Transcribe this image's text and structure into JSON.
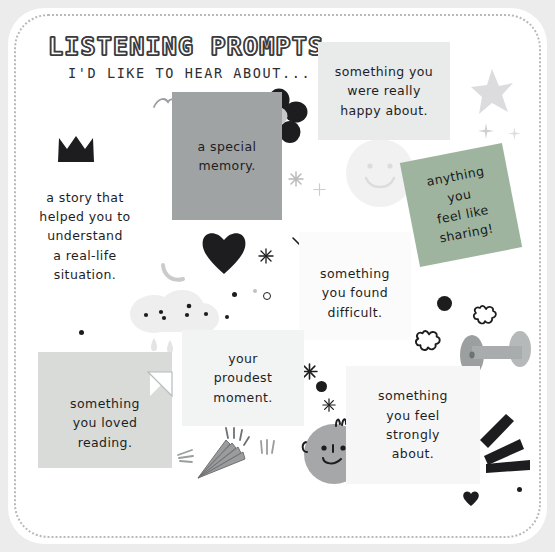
{
  "page": {
    "background_color": "#ececed",
    "card_color": "#ffffff",
    "border_style": "dotted",
    "border_color": "#b9b9bb"
  },
  "header": {
    "title": "LISTENING PROMPTS",
    "subtitle": "I'D LIKE TO HEAR ABOUT..."
  },
  "notes": [
    {
      "id": "story",
      "text": "a story that\nhelped you to\nunderstand\na real-life\nsituation.",
      "color": "transparent"
    },
    {
      "id": "special",
      "text": "a special\nmemory.",
      "color": "#a0a3a4"
    },
    {
      "id": "happy",
      "text": "something you\nwere really\nhappy about.",
      "color": "#e9eaea"
    },
    {
      "id": "anything",
      "text": "anything\nyou\nfeel like\nsharing!",
      "color": "#9fb49e"
    },
    {
      "id": "difficult",
      "text": "something\nyou found\ndifficult.",
      "color": "#fbfbfb"
    },
    {
      "id": "proudest",
      "text": "your\nproudest\nmoment.",
      "color": "#f2f3f3"
    },
    {
      "id": "reading",
      "text": "something\nyou loved\nreading.",
      "color": "#d8dbd8"
    },
    {
      "id": "strongly",
      "text": "something\nyou feel\nstrongly\nabout.",
      "color": "#f6f6f6"
    }
  ],
  "decorations": [
    {
      "name": "crown-icon",
      "color": "#1d1d1f"
    },
    {
      "name": "flower-icon",
      "color": "#1d1d1f"
    },
    {
      "name": "heart-icon",
      "color": "#1d1d1f"
    },
    {
      "name": "star-icon",
      "color": "#dcdcde"
    },
    {
      "name": "smiley-face-icon",
      "color": "#f0f0f1"
    },
    {
      "name": "cloud-rain-icon",
      "color": "#eeeeef"
    },
    {
      "name": "dumbbell-icon",
      "color": "#a9abac"
    },
    {
      "name": "party-popper-icon",
      "color": "#9a9c9d"
    },
    {
      "name": "doodle-face-icon",
      "color": "#a5a7a9"
    },
    {
      "name": "burst-lines-icon",
      "color": "#1d1d1f"
    },
    {
      "name": "bird-icon",
      "color": "#9a9c9d"
    },
    {
      "name": "banana-icon",
      "color": "#c9cbcc"
    },
    {
      "name": "sparkle-icon",
      "color": "#1d1d1f"
    },
    {
      "name": "outline-flower-icon",
      "color": "#1d1d1f"
    },
    {
      "name": "dot-icon",
      "color": "#1d1d1f"
    },
    {
      "name": "small-heart-icon",
      "color": "#1d1d1f"
    }
  ]
}
